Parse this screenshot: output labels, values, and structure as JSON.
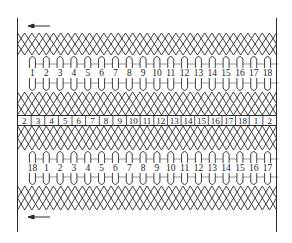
{
  "diagram": {
    "type": "stator-winding-expanded-diagram",
    "colors": {
      "line": "#2a2a2a",
      "background": "#ffffff"
    },
    "top_arrow": {
      "direction": "left"
    },
    "bottom_arrow": {
      "direction": "left"
    },
    "top_coil_labels": [
      "1",
      "2",
      "3",
      "4",
      "5",
      "6",
      "7",
      "8",
      "9",
      "10",
      "11",
      "12",
      "13",
      "14",
      "15",
      "16",
      "17",
      "18"
    ],
    "slot_numbers": [
      "2",
      "3",
      "4",
      "5",
      "6",
      "7",
      "8",
      "9",
      "10",
      "11",
      "12",
      "13",
      "14",
      "15",
      "16",
      "17",
      "18",
      "1",
      "2"
    ],
    "bottom_coil_labels": [
      "18",
      "1",
      "2",
      "3",
      "4",
      "5",
      "6",
      "7",
      "8",
      "9",
      "10",
      "11",
      "12",
      "13",
      "14",
      "15",
      "16",
      "17"
    ]
  }
}
